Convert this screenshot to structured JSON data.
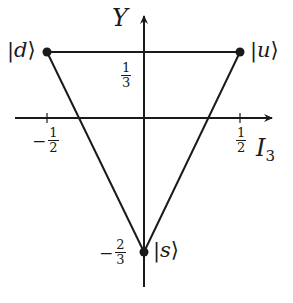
{
  "diagram": {
    "type": "quark-flavor-triangle",
    "axes": {
      "x": {
        "label": "I",
        "subscript": "3",
        "ticks": [
          {
            "value": "-1/2",
            "num": "1",
            "den": "2",
            "sign": "−"
          },
          {
            "value": "1/2",
            "num": "1",
            "den": "2",
            "sign": ""
          }
        ]
      },
      "y": {
        "label": "Y",
        "ticks": [
          {
            "value": "1/3",
            "num": "1",
            "den": "3",
            "sign": ""
          },
          {
            "value": "-2/3",
            "num": "2",
            "den": "3",
            "sign": "−"
          }
        ]
      }
    },
    "states": [
      {
        "name": "d",
        "bra": "|",
        "ket": "⟩",
        "I3": "-1/2",
        "Y": "1/3"
      },
      {
        "name": "u",
        "bra": "|",
        "ket": "⟩",
        "I3": "1/2",
        "Y": "1/3"
      },
      {
        "name": "s",
        "bra": "|",
        "ket": "⟩",
        "I3": "0",
        "Y": "-2/3"
      }
    ],
    "colors": {
      "ink": "#1a1a1a",
      "background": "#ffffff"
    }
  }
}
